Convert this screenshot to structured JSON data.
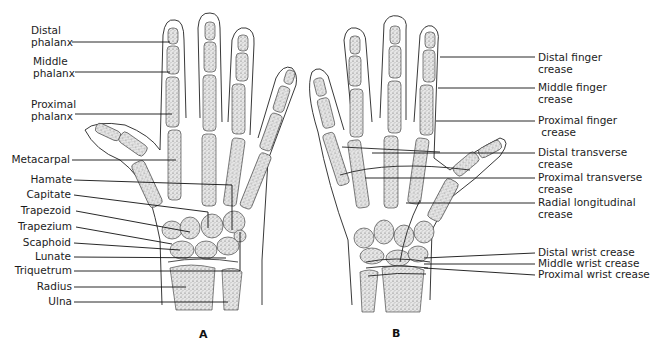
{
  "figure": {
    "panels": [
      {
        "id": "A",
        "letter": "A",
        "view": "dorsal skeleton of hand",
        "labels": [
          {
            "line1": "Distal",
            "line2": "phalanx"
          },
          {
            "line1": "Middle",
            "line2": "phalanx"
          },
          {
            "line1": "Proximal",
            "line2": "phalanx"
          },
          {
            "line1": "Metacarpal"
          },
          {
            "line1": "Hamate"
          },
          {
            "line1": "Capitate"
          },
          {
            "line1": "Trapezoid"
          },
          {
            "line1": "Trapezium"
          },
          {
            "line1": "Scaphoid"
          },
          {
            "line1": "Lunate"
          },
          {
            "line1": "Triquetrum"
          },
          {
            "line1": "Radius"
          },
          {
            "line1": "Ulna"
          }
        ]
      },
      {
        "id": "B",
        "letter": "B",
        "view": "palmar surface with creases",
        "labels": [
          {
            "line1": "Distal finger",
            "line2": "crease"
          },
          {
            "line1": "Middle finger",
            "line2": "crease"
          },
          {
            "line1": "Proximal finger",
            "line2": " crease"
          },
          {
            "line1": "Distal transverse",
            "line2": "crease"
          },
          {
            "line1": "Proximal transverse",
            "line2": "crease"
          },
          {
            "line1": "Radial longitudinal",
            "line2": "crease"
          },
          {
            "line1": "Distal wrist crease"
          },
          {
            "line1": "Middle wrist crease"
          },
          {
            "line1": "Proximal wrist crease"
          }
        ]
      }
    ]
  }
}
